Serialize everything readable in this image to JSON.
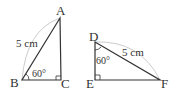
{
  "triangle_abc": {
    "vertices": {
      "A": "A",
      "B": "B",
      "C": "C"
    },
    "hypotenuse_label": "5 cm",
    "angle_label": "60°",
    "angle_at": "B",
    "right_angle_at": "C"
  },
  "triangle_def": {
    "vertices": {
      "D": "D",
      "E": "E",
      "F": "F"
    },
    "hypotenuse_label": "5 cm",
    "angle_label": "60°",
    "angle_at": "D",
    "right_angle_at": "E"
  },
  "colors": {
    "stroke": "#333333",
    "arc": "#cccccc"
  }
}
